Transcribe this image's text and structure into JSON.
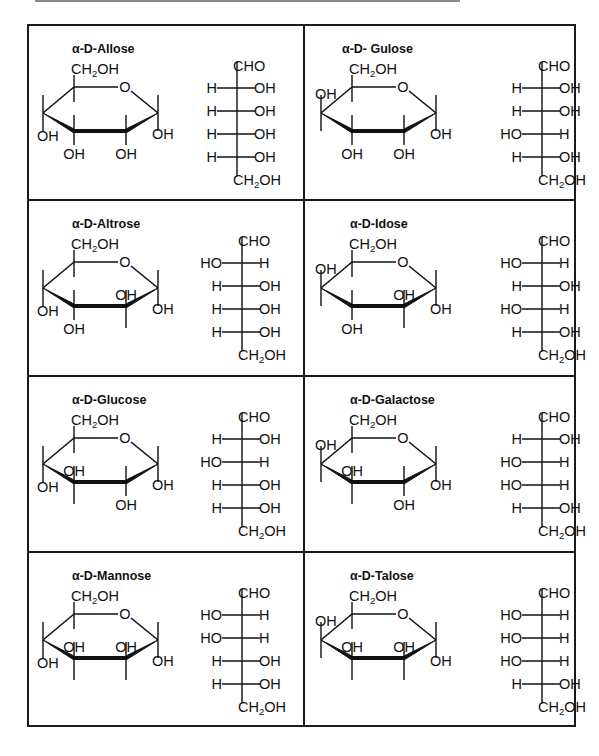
{
  "labels": {
    "ring_oxygen": "O",
    "hydroxyl": "OH",
    "hydroxyl_left": "HO",
    "hydrogen": "H",
    "aldehyde": "CHO",
    "hydroxymethyl_prefix": "CH",
    "hydroxymethyl_subscript": "2",
    "hydroxymethyl_suffix": "OH"
  },
  "sugars": [
    {
      "name": "α-D-Allose",
      "haworth": {
        "C1": "down",
        "C2": "down",
        "C3": "down",
        "C4": "down"
      },
      "fischer": [
        [
          "H",
          "OH"
        ],
        [
          "H",
          "OH"
        ],
        [
          "H",
          "OH"
        ],
        [
          "H",
          "OH"
        ]
      ]
    },
    {
      "name": "α-D- Gulose",
      "haworth": {
        "C1": "down",
        "C2": "down",
        "C3": "down",
        "C4": "up"
      },
      "fischer": [
        [
          "H",
          "OH"
        ],
        [
          "H",
          "OH"
        ],
        [
          "HO",
          "H"
        ],
        [
          "H",
          "OH"
        ]
      ]
    },
    {
      "name": "α-D-Altrose",
      "haworth": {
        "C1": "down",
        "C2": "up",
        "C3": "down",
        "C4": "down"
      },
      "fischer": [
        [
          "HO",
          "H"
        ],
        [
          "H",
          "OH"
        ],
        [
          "H",
          "OH"
        ],
        [
          "H",
          "OH"
        ]
      ]
    },
    {
      "name": "α-D-Idose",
      "haworth": {
        "C1": "down",
        "C2": "up",
        "C3": "down",
        "C4": "up"
      },
      "fischer": [
        [
          "HO",
          "H"
        ],
        [
          "H",
          "OH"
        ],
        [
          "HO",
          "H"
        ],
        [
          "H",
          "OH"
        ]
      ]
    },
    {
      "name": "α-D-Glucose",
      "haworth": {
        "C1": "down",
        "C2": "down",
        "C3": "up",
        "C4": "down"
      },
      "fischer": [
        [
          "H",
          "OH"
        ],
        [
          "HO",
          "H"
        ],
        [
          "H",
          "OH"
        ],
        [
          "H",
          "OH"
        ]
      ]
    },
    {
      "name": "α-D-Galactose",
      "haworth": {
        "C1": "down",
        "C2": "down",
        "C3": "up",
        "C4": "up"
      },
      "fischer": [
        [
          "H",
          "OH"
        ],
        [
          "HO",
          "H"
        ],
        [
          "HO",
          "H"
        ],
        [
          "H",
          "OH"
        ]
      ]
    },
    {
      "name": "α-D-Mannose",
      "haworth": {
        "C1": "down",
        "C2": "up",
        "C3": "up",
        "C4": "down"
      },
      "fischer": [
        [
          "HO",
          "H"
        ],
        [
          "HO",
          "H"
        ],
        [
          "H",
          "OH"
        ],
        [
          "H",
          "OH"
        ]
      ]
    },
    {
      "name": "α-D-Talose",
      "haworth": {
        "C1": "down",
        "C2": "up",
        "C3": "up",
        "C4": "up"
      },
      "fischer": [
        [
          "HO",
          "H"
        ],
        [
          "HO",
          "H"
        ],
        [
          "HO",
          "H"
        ],
        [
          "H",
          "OH"
        ]
      ]
    }
  ],
  "colors": {
    "ink": "#111111",
    "border": "#1a1a1a",
    "background": "#ffffff",
    "top_rule": "#8a8a8a"
  }
}
